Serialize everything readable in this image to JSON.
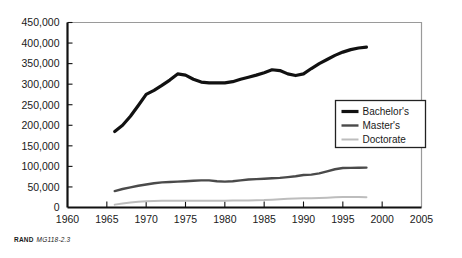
{
  "figure": {
    "source_org": "RAND",
    "source_id": "MG118-2.3"
  },
  "axes": {
    "y_ticks": [
      "0",
      "50,000",
      "100,000",
      "150,000",
      "200,000",
      "250,000",
      "300,000",
      "350,000",
      "400,000",
      "450,000"
    ],
    "x_ticks": [
      "1960",
      "1965",
      "1970",
      "1975",
      "1980",
      "1985",
      "1990",
      "1995",
      "2000",
      "2005"
    ]
  },
  "legend": {
    "position": "inside-right",
    "items": [
      {
        "label": "Bachelor's",
        "color": "#111111",
        "width": 3.2
      },
      {
        "label": "Master's",
        "color": "#4a4a4a",
        "width": 2.4
      },
      {
        "label": "Doctorate",
        "color": "#bdbdbd",
        "width": 2.0
      }
    ]
  },
  "colors": {
    "bachelors": "#111111",
    "masters": "#4a4a4a",
    "doctorate": "#bdbdbd",
    "frame": "#9a9a9a",
    "axis": "#111111",
    "text": "#1a1a1a"
  },
  "chart_data": {
    "type": "line",
    "title": "",
    "subtitle": "",
    "xlabel": "",
    "ylabel": "",
    "xlim": [
      1960,
      2005
    ],
    "ylim": [
      0,
      450000
    ],
    "x_tick_step": 5,
    "y_tick_step": 50000,
    "grid": false,
    "legend_position": "inside-right",
    "x": [
      1966,
      1967,
      1968,
      1969,
      1970,
      1971,
      1972,
      1973,
      1974,
      1975,
      1976,
      1977,
      1978,
      1979,
      1980,
      1981,
      1982,
      1983,
      1984,
      1985,
      1986,
      1987,
      1988,
      1989,
      1990,
      1991,
      1992,
      1993,
      1994,
      1995,
      1996,
      1997,
      1998
    ],
    "series": [
      {
        "name": "Bachelor's",
        "color": "#111111",
        "values": [
          185000,
          200000,
          222000,
          248000,
          275000,
          285000,
          297000,
          310000,
          325000,
          322000,
          312000,
          305000,
          303000,
          303000,
          303000,
          306000,
          312000,
          317000,
          322000,
          328000,
          335000,
          333000,
          325000,
          321000,
          325000,
          338000,
          350000,
          360000,
          370000,
          378000,
          384000,
          388000,
          390000
        ]
      },
      {
        "name": "Master's",
        "color": "#4a4a4a",
        "values": [
          40000,
          45000,
          49000,
          53000,
          56000,
          59000,
          61000,
          62000,
          63000,
          64000,
          65000,
          66000,
          66000,
          64000,
          63000,
          64000,
          66000,
          68000,
          69000,
          70000,
          71000,
          72000,
          74000,
          76000,
          79000,
          80000,
          83000,
          88000,
          93000,
          96000,
          96500,
          96800,
          97000
        ]
      },
      {
        "name": "Doctorate",
        "color": "#bdbdbd",
        "values": [
          7000,
          9500,
          12000,
          14000,
          15500,
          16000,
          16500,
          16500,
          16500,
          16500,
          16500,
          16500,
          16500,
          16500,
          16500,
          16800,
          17000,
          17200,
          17500,
          18000,
          19000,
          20000,
          21000,
          22000,
          22500,
          22800,
          23200,
          24000,
          25000,
          25500,
          25800,
          25500,
          25000
        ]
      }
    ]
  }
}
